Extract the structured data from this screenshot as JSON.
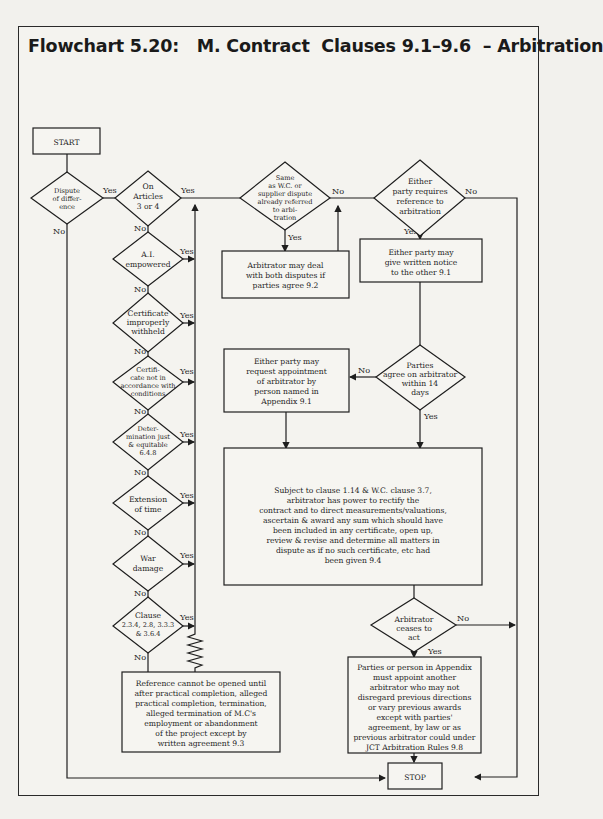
{
  "title": "Flowchart 5.20:   M. Contract  Clauses 9.1–9.6  – Arbitration",
  "nodes": {
    "start": "START",
    "stop": "STOP",
    "dispute": [
      "Dispute",
      "of differ-",
      "ence"
    ],
    "articles": [
      "On",
      "Articles",
      "3 or 4"
    ],
    "ai_empowered": [
      "A.I.",
      "empowered"
    ],
    "certificate_withheld": [
      "Certificate",
      "improperly",
      "withheld"
    ],
    "certificate_conditions": [
      "Certifi-",
      "cate not in",
      "accordance with",
      "conditions"
    ],
    "determination": [
      "Deter-",
      "mination just",
      "& equitable",
      "6.4.8"
    ],
    "extension": [
      "Extension",
      "of time"
    ],
    "war_damage": [
      "War",
      "damage"
    ],
    "clause": [
      "Clause",
      "2.3.4, 2.8, 3.3.3",
      "& 3.6.4"
    ],
    "reference_box": [
      "Reference cannot be opened until",
      "after practical completion, alleged",
      "practical completion, termination,",
      "alleged termination of M.C's",
      "employment or abandonment",
      "of the project except by",
      "written agreement 9.3"
    ],
    "same_dispute": [
      "Same",
      "as W.C. or",
      "supplier dispute",
      "already referred",
      "to arbi-",
      "tration"
    ],
    "both_disputes_box": [
      "Arbitrator may deal",
      "with both disputes if",
      "parties agree 9.2"
    ],
    "either_requires": [
      "Either",
      "party requires",
      "reference to",
      "arbitration"
    ],
    "written_notice_box": [
      "Either party may",
      "give written notice",
      "to the other 9.1"
    ],
    "parties_agree": [
      "Parties",
      "agree on arbitrator",
      "within 14",
      "days"
    ],
    "request_appointment_box": [
      "Either party may",
      "request appointment",
      "of arbitrator by",
      "person named in",
      "Appendix 9.1"
    ],
    "power_box": [
      "Subject to clause 1.14 & W.C. clause 3.7,",
      "arbitrator has power to rectify the",
      "contract and to direct measurements/valuations,",
      "ascertain & award any sum which should have",
      "been included in any certificate, open up,",
      "review & revise and determine all matters in",
      "dispute as if no such certificate, etc had",
      "been given 9.4"
    ],
    "ceases": [
      "Arbitrator",
      "ceases to",
      "act"
    ],
    "appoint_another_box": [
      "Parties or person in Appendix",
      "must appoint another",
      "arbitrator who may not",
      "disregard previous directions",
      "or vary previous awards",
      "except with parties'",
      "agreement, by law or as",
      "previous arbitrator could under",
      "JCT Arbitration Rules 9.8"
    ]
  },
  "labels": {
    "yes": "Yes",
    "no": "No"
  },
  "colors": {
    "line": "#1e1e1e",
    "paper": "#f4f3ef",
    "frame": "#2a2a2a"
  }
}
